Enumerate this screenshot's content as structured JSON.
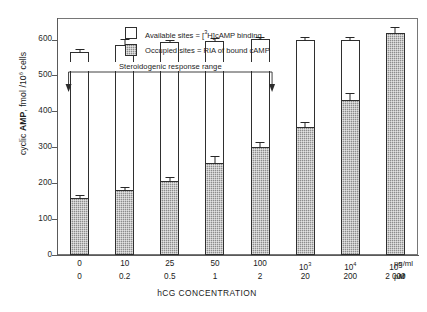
{
  "chart_data": {
    "type": "bar",
    "title": "",
    "xlabel": "hCG CONCENTRATION",
    "ylabel": "cyclic AMP, fmol /10⁶ cells",
    "ylim": [
      0,
      660
    ],
    "yticks": [
      0,
      100,
      200,
      300,
      400,
      500,
      600
    ],
    "ytick_labels": [
      "0",
      "100",
      "200",
      "300",
      "400",
      "500",
      "600"
    ],
    "grid": false,
    "stacked": true,
    "categories": [
      "0",
      "10",
      "25",
      "50",
      "100",
      "10³",
      "10⁴",
      "10⁵"
    ],
    "categories_row1": [
      {
        "text": "0",
        "sup": ""
      },
      {
        "text": "10",
        "sup": ""
      },
      {
        "text": "25",
        "sup": ""
      },
      {
        "text": "50",
        "sup": ""
      },
      {
        "text": "100",
        "sup": ""
      },
      {
        "text": "10",
        "sup": "3"
      },
      {
        "text": "10",
        "sup": "4"
      },
      {
        "text": "10",
        "sup": "5"
      }
    ],
    "categories_row2": [
      "0",
      "0.2",
      "0.5",
      "1",
      "2",
      "20",
      "200",
      "2 000"
    ],
    "row1_unit": "pg/ml",
    "row2_unit": "pM",
    "series": [
      {
        "name": "Occupied sites = RIA of bound cAMP",
        "values": [
          158,
          180,
          206,
          257,
          302,
          356,
          432,
          618
        ],
        "errors": [
          10,
          10,
          12,
          18,
          13,
          13,
          20,
          0
        ],
        "color": "#8d8d8d",
        "fill": "hatched"
      },
      {
        "name": "Available sites = [3H]cAMP binding",
        "values": [
          565,
          585,
          592,
          597,
          602,
          598,
          598,
          618
        ],
        "errors": [
          9,
          17,
          7,
          6,
          5,
          10,
          8,
          16
        ],
        "color": "#ffffff",
        "fill": "open",
        "note": "total bar height (available + occupied)"
      }
    ],
    "annotations": [
      {
        "text": "Steroidogenic response range",
        "type": "bracket-with-arrows",
        "from_category": "0",
        "to_category": "100"
      }
    ],
    "legend": [
      {
        "swatch": "open",
        "label_pre": "Available sites = [",
        "sup": "3",
        "label_post": "H]cAMP binding"
      },
      {
        "swatch": "hatched",
        "label_pre": "Occupied sites = RIA of bound cAMP",
        "sup": "",
        "label_post": ""
      }
    ],
    "legend_position": "inside-top-left"
  },
  "axes": {
    "y_title_pre": "cyclic ",
    "y_title_bold": "AMP",
    "y_title_mid": ", fmol /10",
    "y_title_sup": "6",
    "y_title_post": " cells",
    "x_title": "hCG CONCENTRATION"
  },
  "legend": {
    "row1_pre": "Available sites = [",
    "row1_sup": "3",
    "row1_post": "H]cAMP binding",
    "row2": "Occupied sites = RIA of bound cAMP"
  },
  "annotation": {
    "label": "Steroidogenic response range"
  },
  "units": {
    "row1": "pg/ml",
    "row2_pre": "p",
    "row2_italic": "M"
  }
}
